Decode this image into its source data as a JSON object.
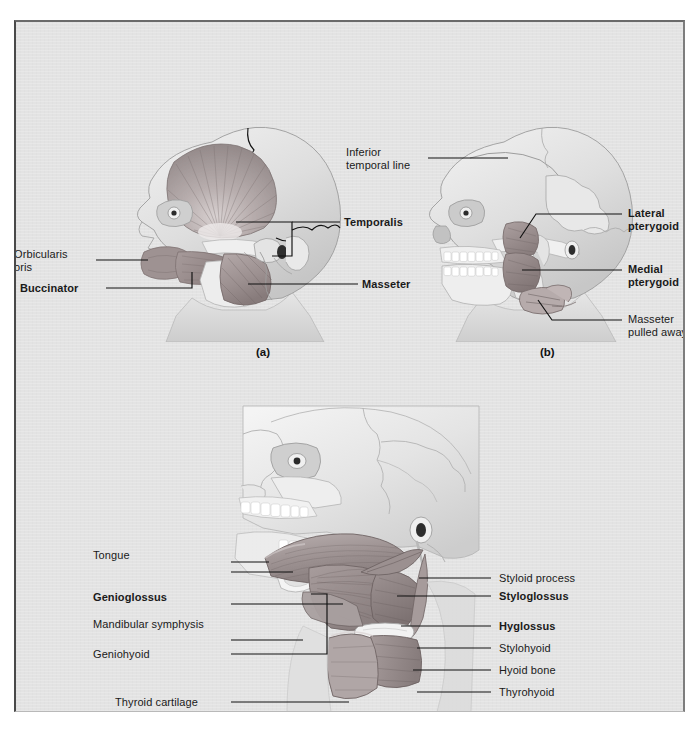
{
  "figure": {
    "background_color": "#e3e3e3",
    "border_color": "#4a4a4a",
    "panels": [
      {
        "id": "a",
        "caption": "(a)",
        "title": "Superficial muscles of mastication",
        "labels": [
          {
            "name": "temporalis",
            "text": "Temporalis",
            "bold": true,
            "align": "left"
          },
          {
            "name": "masseter",
            "text": "Masseter",
            "bold": true,
            "align": "left"
          },
          {
            "name": "orbicularis-oris",
            "text": "Orbicularis\noris",
            "bold": false,
            "align": "left"
          },
          {
            "name": "buccinator",
            "text": "Buccinator",
            "bold": true,
            "align": "left"
          }
        ]
      },
      {
        "id": "b",
        "caption": "(b)",
        "title": "Deep muscles of mastication, masseter removed",
        "labels": [
          {
            "name": "inferior-temporal-line",
            "text": "Inferior\ntemporal line",
            "bold": false,
            "align": "left"
          },
          {
            "name": "lateral-pterygoid",
            "text": "Lateral\npterygoid",
            "bold": true,
            "align": "left"
          },
          {
            "name": "medial-pterygoid",
            "text": "Medial\npterygoid",
            "bold": true,
            "align": "left"
          },
          {
            "name": "masseter-pulled-away",
            "text": "Masseter\npulled away",
            "bold": false,
            "align": "left"
          }
        ]
      },
      {
        "id": "c",
        "caption": "(c)",
        "title": "Muscles of the tongue and hyoid region",
        "labels": [
          {
            "name": "tongue",
            "text": "Tongue",
            "bold": false,
            "align": "right"
          },
          {
            "name": "genioglossus",
            "text": "Genioglossus",
            "bold": true,
            "align": "right"
          },
          {
            "name": "mandibular-symphysis",
            "text": "Mandibular symphysis",
            "bold": false,
            "align": "right"
          },
          {
            "name": "geniohyoid",
            "text": "Geniohyoid",
            "bold": false,
            "align": "right"
          },
          {
            "name": "thyroid-cartilage",
            "text": "Thyroid cartilage",
            "bold": false,
            "align": "right"
          },
          {
            "name": "styloid-process",
            "text": "Styloid process",
            "bold": false,
            "align": "left"
          },
          {
            "name": "styloglossus",
            "text": "Styloglossus",
            "bold": true,
            "align": "left"
          },
          {
            "name": "hyglossus",
            "text": "Hyglossus",
            "bold": true,
            "align": "left"
          },
          {
            "name": "stylohyoid",
            "text": "Stylohyoid",
            "bold": false,
            "align": "left"
          },
          {
            "name": "hyoid-bone",
            "text": "Hyoid bone",
            "bold": false,
            "align": "left"
          },
          {
            "name": "thyrohyoid",
            "text": "Thyrohyoid",
            "bold": false,
            "align": "left"
          }
        ]
      }
    ]
  }
}
